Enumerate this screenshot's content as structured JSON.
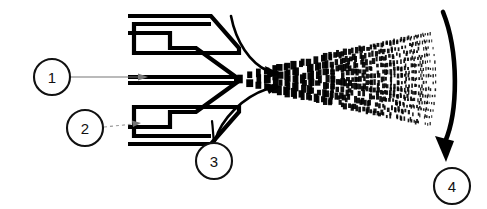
{
  "figure": {
    "background_color": "#ffffff",
    "ink_color": "#000000",
    "leader_color": "#777777",
    "width": 487,
    "height": 209
  },
  "callouts": [
    {
      "id": "callout-1",
      "label": "1",
      "cx": 52,
      "cy": 77,
      "r": 18,
      "leader_style": "solid",
      "leader_from_x": 70,
      "leader_from_y": 77,
      "leader_to_x": 128,
      "leader_to_y": 77
    },
    {
      "id": "callout-2",
      "label": "2",
      "cx": 85,
      "cy": 128,
      "r": 18,
      "leader_style": "dashed",
      "leader_from_x": 103,
      "leader_from_y": 127,
      "leader_to_x": 133,
      "leader_to_y": 125
    },
    {
      "id": "callout-3",
      "label": "3",
      "cx": 214,
      "cy": 161,
      "r": 18,
      "leader_style": "curve",
      "leader_from_x": 214,
      "leader_from_y": 143,
      "leader_to_x": 213,
      "leader_to_y": 122
    },
    {
      "id": "callout-4",
      "label": "4",
      "cx": 452,
      "cy": 186,
      "r": 18,
      "leader_style": "none",
      "leader_from_x": 452,
      "leader_from_y": 168,
      "leader_to_x": 450,
      "leader_to_y": 160
    }
  ],
  "nozzle": {
    "name": "air-atomizing-nozzle",
    "tip_x": 237,
    "tip_y": 79,
    "body_left_x": 128,
    "body_top_y": 14,
    "body_bottom_y": 146,
    "outer_cap_upper": "M 128,14 L 213,14 L 238,45 L 238,52 L 132,52 L 132,22 L 212,22",
    "outer_cap_lower": "M 128,146 L 213,146 L 238,115 L 238,108 L 132,108 L 132,138 L 212,138",
    "inner_body_upper": "M 128,32 L 172,32 L 172,48 L 196,48 L 237,77 L 128,77 Z",
    "inner_body_lower": "M 128,128 L 172,128 L 172,112 L 196,112 L 237,82 L 128,82 Z"
  },
  "flow_arrows": [
    {
      "name": "air-stream-upper",
      "path": "M 232,16 C 236,40 250,62 270,71",
      "head_x": 276,
      "head_y": 72,
      "angle": 22
    },
    {
      "name": "air-stream-lower",
      "path": "M 216,140 C 222,118 244,96 268,88",
      "head_x": 275,
      "head_y": 87,
      "angle": -18
    }
  ],
  "target": {
    "name": "target-surface-arc",
    "path": "M 443,12 C 458,50 458,110 446,146",
    "head_x": 446,
    "head_y": 152,
    "description": "curved substrate / target surface"
  },
  "spray": {
    "name": "atomized-spray-plume",
    "origin_x": 240,
    "origin_y": 79,
    "end_x": 432,
    "end_y": 79,
    "half_angle_deg": 13,
    "columns": 26,
    "description": "liquid sheet breaking into progressively finer droplets"
  },
  "legend": {
    "items": [
      {
        "number": "1",
        "name": "liquid-feed-passage"
      },
      {
        "number": "2",
        "name": "nozzle-body-air-cap"
      },
      {
        "number": "3",
        "name": "atomizing-air-stream"
      },
      {
        "number": "4",
        "name": "target-surface"
      }
    ]
  }
}
